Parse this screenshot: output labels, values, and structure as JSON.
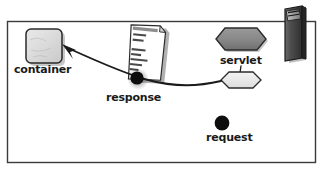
{
  "diagram": {
    "frame": {
      "name": "outer-frame",
      "stroke": "#3b3b3b"
    },
    "background": "#ffffff",
    "nodes": [
      {
        "id": "container",
        "label": "container",
        "shape": "rounded-square",
        "fill": "#dcdcdc",
        "stroke": "#2b2b2b"
      },
      {
        "id": "response-document",
        "label": "",
        "shape": "document-page",
        "fill": "#ffffff",
        "stroke": "#2b2b2b",
        "header_text": "HTML • page",
        "body_lines": [
          "<html>",
          "<head>",
          "",
          "</head>",
          "<body>",
          "<p> ... </p>",
          "</body>"
        ]
      },
      {
        "id": "servlet",
        "label": "servlet",
        "shape": "hexagon",
        "fill": "#8a8a8a",
        "stroke": "#2b2b2b"
      },
      {
        "id": "servlet-instance",
        "label": "",
        "shape": "hexagon",
        "fill": "#ebebeb",
        "stroke": "#2b2b2b"
      },
      {
        "id": "server-tower",
        "label": "",
        "shape": "server-tower",
        "fill": "#4a4a4a",
        "stroke": "#1a1a1a"
      },
      {
        "id": "response-dot",
        "label": "response",
        "shape": "dot",
        "fill": "#0d0d0d"
      },
      {
        "id": "request-dot",
        "label": "request",
        "shape": "dot",
        "fill": "#0d0d0d"
      }
    ],
    "edges": [
      {
        "id": "response-flow",
        "from": "servlet-instance",
        "to": "container",
        "style": "curved-arrow",
        "arrowhead": "at-container",
        "stroke": "#1a1a1a"
      },
      {
        "id": "servlet-tick",
        "from": "servlet",
        "to": "servlet-instance",
        "style": "short-line",
        "stroke": "#1a1a1a"
      }
    ],
    "labels": {
      "container": "container",
      "response": "response",
      "servlet": "servlet",
      "request": "request"
    }
  }
}
